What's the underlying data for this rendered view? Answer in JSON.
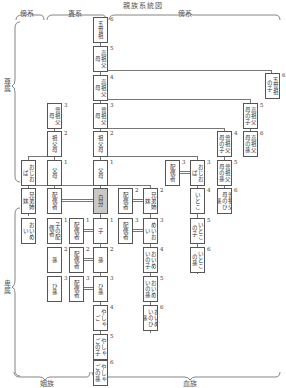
{
  "title": "親族系統図",
  "headers": {
    "left": "傍系",
    "center": "直系",
    "right": "傍系"
  },
  "side_labels": {
    "upper": "尊属",
    "lower": "卑属"
  },
  "bottom_labels": {
    "left": "姻族",
    "right": "血族"
  },
  "nodes": [
    {
      "id": "a6",
      "label": "五世祖",
      "deg": "6",
      "x": 93,
      "y": 17
    },
    {
      "id": "a5",
      "label": "高祖父母",
      "deg": "5",
      "x": 93,
      "y": 46
    },
    {
      "id": "a4",
      "label": "高祖父母",
      "deg": "4",
      "x": 93,
      "y": 75
    },
    {
      "id": "a3",
      "label": "曾祖父母",
      "deg": "3",
      "x": 93,
      "y": 103
    },
    {
      "id": "a2",
      "label": "祖父母",
      "deg": "2",
      "x": 93,
      "y": 131
    },
    {
      "id": "a1",
      "label": "父母",
      "deg": "1",
      "x": 93,
      "y": 160
    },
    {
      "id": "self",
      "label": "自分",
      "deg": "",
      "x": 93,
      "y": 188
    },
    {
      "id": "d1",
      "label": "子",
      "deg": "1",
      "x": 93,
      "y": 218
    },
    {
      "id": "d2",
      "label": "孫",
      "deg": "2",
      "x": 93,
      "y": 247
    },
    {
      "id": "d3",
      "label": "ひ孫",
      "deg": "3",
      "x": 93,
      "y": 276
    },
    {
      "id": "d4",
      "label": "やしゃご",
      "deg": "4",
      "x": 93,
      "y": 305
    },
    {
      "id": "d5",
      "label": "やしゃごの子",
      "deg": "5",
      "x": 93,
      "y": 334
    },
    {
      "id": "d6",
      "label": "やしゃごの孫",
      "deg": "6",
      "x": 93,
      "y": 360
    },
    {
      "id": "sa3",
      "label": "曾祖父母",
      "deg": "3",
      "x": 47,
      "y": 103
    },
    {
      "id": "sa2",
      "label": "祖父母",
      "deg": "2",
      "x": 47,
      "y": 131
    },
    {
      "id": "sa1",
      "label": "父母",
      "deg": "1",
      "x": 47,
      "y": 160
    },
    {
      "id": "sauncle",
      "label": "おじおば",
      "deg": "",
      "x": 21,
      "y": 160
    },
    {
      "id": "spouse",
      "label": "配偶者",
      "deg": "",
      "x": 47,
      "y": 188
    },
    {
      "id": "ssib",
      "label": "兄弟姉妹",
      "deg": "",
      "x": 21,
      "y": 188
    },
    {
      "id": "snephew",
      "label": "おいめい",
      "deg": "",
      "x": 21,
      "y": 218
    },
    {
      "id": "cspouse",
      "label": "子の配偶者",
      "deg": "1",
      "x": 47,
      "y": 218
    },
    {
      "id": "sp1",
      "label": "配偶者",
      "deg": "1",
      "x": 69,
      "y": 218
    },
    {
      "id": "sp2",
      "label": "配偶者",
      "deg": "2",
      "x": 69,
      "y": 247
    },
    {
      "id": "gspouse",
      "label": "孫",
      "deg": "2",
      "x": 47,
      "y": 247
    },
    {
      "id": "sp3",
      "label": "配偶者",
      "deg": "3",
      "x": 69,
      "y": 276
    },
    {
      "id": "hspouse",
      "label": "ひ孫",
      "deg": "3",
      "x": 47,
      "y": 276
    },
    {
      "id": "sibsp",
      "label": "配偶者",
      "deg": "2",
      "x": 118,
      "y": 188
    },
    {
      "id": "sib",
      "label": "兄弟姉妹",
      "deg": "2",
      "x": 143,
      "y": 188
    },
    {
      "id": "neph_sp",
      "label": "配偶者",
      "deg": "3",
      "x": 118,
      "y": 218
    },
    {
      "id": "neph",
      "label": "めいおい",
      "deg": "3",
      "x": 143,
      "y": 218
    },
    {
      "id": "neph_c",
      "label": "おいめいの子",
      "deg": "4",
      "x": 143,
      "y": 247
    },
    {
      "id": "neph_g",
      "label": "おいめいの孫",
      "deg": "5",
      "x": 143,
      "y": 276
    },
    {
      "id": "neph_gg",
      "label": "おいめいのひ孫",
      "deg": "6",
      "x": 143,
      "y": 305
    },
    {
      "id": "unc_sp",
      "label": "配偶者",
      "deg": "3",
      "x": 165,
      "y": 160
    },
    {
      "id": "unc",
      "label": "おじおば",
      "deg": "3",
      "x": 190,
      "y": 160
    },
    {
      "id": "cous",
      "label": "いとこ",
      "deg": "4",
      "x": 190,
      "y": 188
    },
    {
      "id": "cous_c",
      "label": "いとこの子",
      "deg": "5",
      "x": 190,
      "y": 218
    },
    {
      "id": "cous_g",
      "label": "いとこの孫",
      "deg": "6",
      "x": 190,
      "y": 247
    },
    {
      "id": "gg_c",
      "label": "曾祖父母の子",
      "deg": "4",
      "x": 217,
      "y": 131
    },
    {
      "id": "gg_g",
      "label": "曾祖父母の孫",
      "deg": "5",
      "x": 217,
      "y": 160
    },
    {
      "id": "gg_gg",
      "label": "曾祖父母のひ孫",
      "deg": "6",
      "x": 217,
      "y": 188
    },
    {
      "id": "hg_c",
      "label": "高祖父母の子",
      "deg": "5",
      "x": 243,
      "y": 103
    },
    {
      "id": "hg_g",
      "label": "高祖父母の孫",
      "deg": "6",
      "x": 243,
      "y": 131
    },
    {
      "id": "fg_c",
      "label": "五世祖の子",
      "deg": "6",
      "x": 265,
      "y": 73
    }
  ]
}
